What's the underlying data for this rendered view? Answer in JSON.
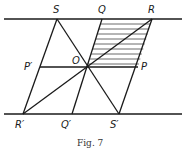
{
  "figure": {
    "caption": "Fig. 7",
    "points": {
      "S": {
        "label": "S",
        "x": 57,
        "y": 19
      },
      "Q": {
        "label": "Q",
        "x": 102,
        "y": 19
      },
      "R": {
        "label": "R",
        "x": 152,
        "y": 19
      },
      "P_prime": {
        "label": "P′",
        "x": 40,
        "y": 67
      },
      "O": {
        "label": "O",
        "x": 87,
        "y": 67
      },
      "P": {
        "label": "P",
        "x": 138,
        "y": 67
      },
      "R_prime": {
        "label": "R′",
        "x": 23,
        "y": 114
      },
      "Q_prime": {
        "label": "Q′",
        "x": 72,
        "y": 114
      },
      "S_prime": {
        "label": "S′",
        "x": 119,
        "y": 114
      }
    },
    "parallel_lines": [
      {
        "name": "top-line",
        "y": 19
      },
      {
        "name": "bottom-line",
        "y": 114
      }
    ],
    "segments": [
      "S-R′",
      "S-S′",
      "Q-Q′",
      "R-S′",
      "R-R′",
      "P′-P"
    ],
    "shaded_region": "Q-R-P-O (horizontal hatching)",
    "colors": {
      "line": "#1a1a1a",
      "background": "#ffffff"
    }
  }
}
